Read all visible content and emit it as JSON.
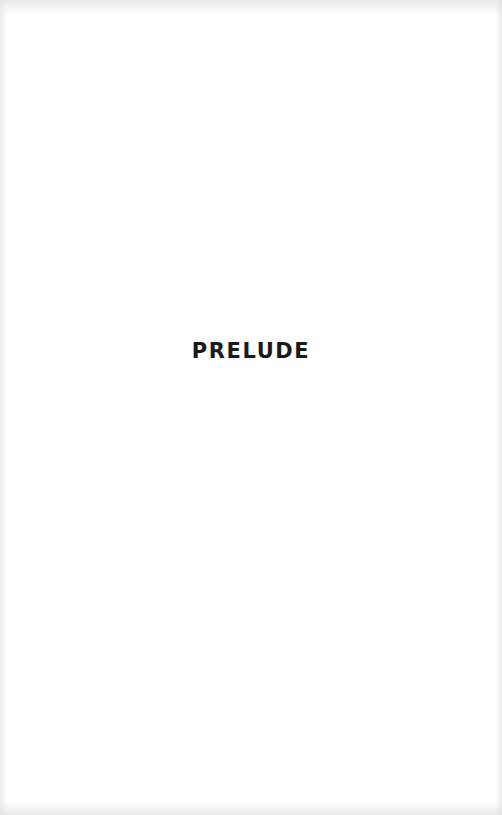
{
  "page": {
    "title": "PRELUDE",
    "text_color": "#1a1a1a",
    "background_color": "#ffffff"
  }
}
